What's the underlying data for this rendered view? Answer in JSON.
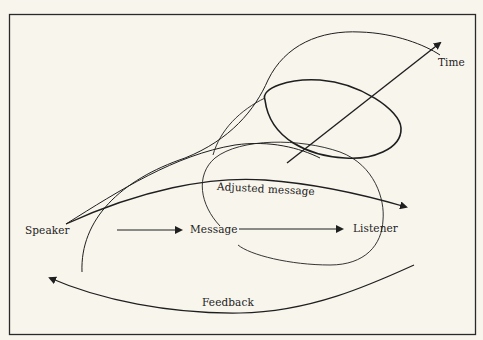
{
  "diagram": {
    "type": "communication-model",
    "colors": {
      "background": "#f8f5ec",
      "ink": "#1f1f1f"
    },
    "labels": {
      "speaker": "Speaker",
      "message": "Message",
      "listener": "Listener",
      "adjusted_message": "Adjusted message",
      "feedback": "Feedback",
      "time": "Time"
    },
    "nodes": [
      {
        "id": "speaker",
        "label": "Speaker"
      },
      {
        "id": "message",
        "label": "Message"
      },
      {
        "id": "listener",
        "label": "Listener"
      }
    ],
    "edges": [
      {
        "from": "speaker",
        "to": "message",
        "label": ""
      },
      {
        "from": "message",
        "to": "listener",
        "label": ""
      },
      {
        "from": "speaker",
        "to": "listener",
        "label": "Adjusted message"
      },
      {
        "from": "listener",
        "to": "speaker",
        "label": "Feedback"
      }
    ],
    "axis": {
      "label": "Time",
      "direction": "diagonal-up-right"
    }
  }
}
